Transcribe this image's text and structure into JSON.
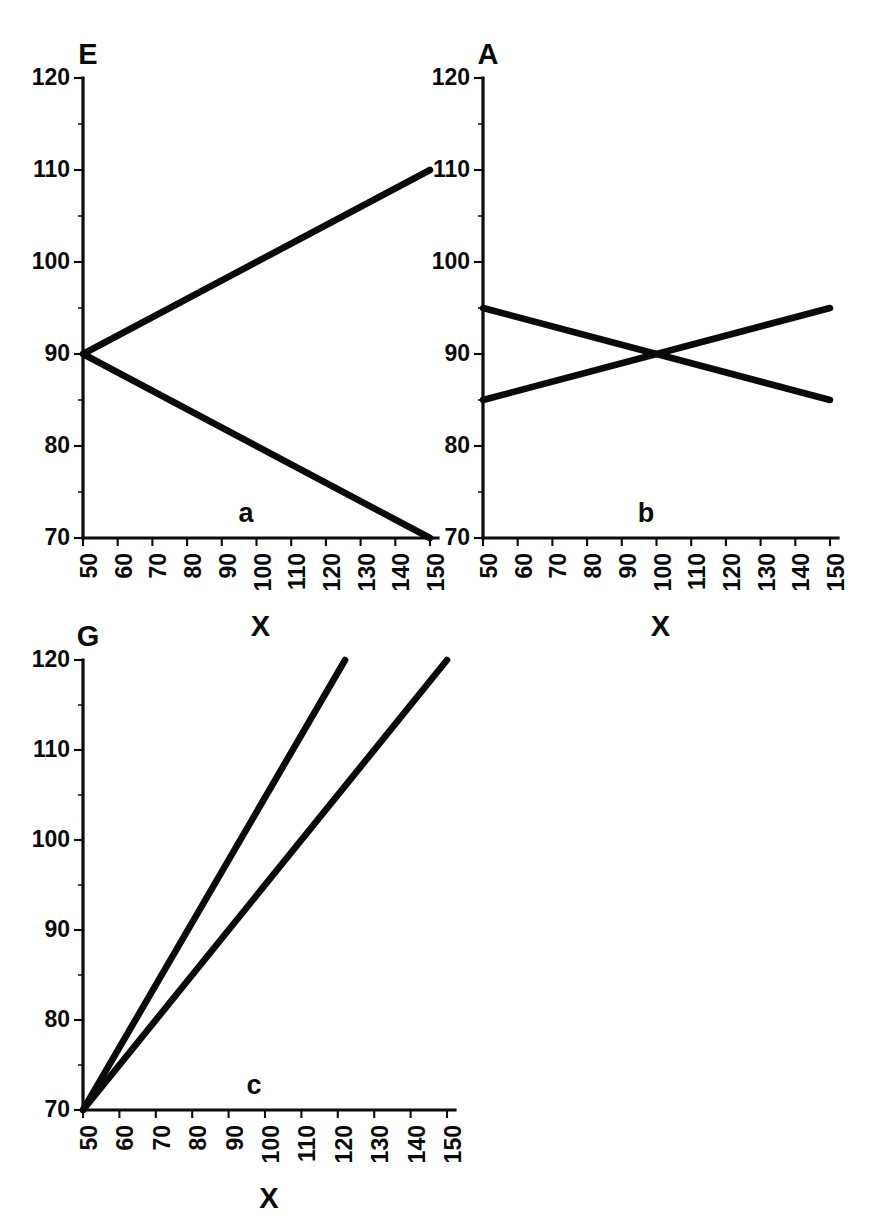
{
  "figure": {
    "background_color": "#ffffff",
    "ink_color": "#0b0b0b",
    "panels": [
      "a",
      "b",
      "c"
    ]
  },
  "chart_data": [
    {
      "id": "a",
      "type": "line",
      "panel_label": "a",
      "title": "",
      "xlabel": "X",
      "ylabel": "E",
      "xlim": [
        50,
        150
      ],
      "ylim": [
        70,
        120
      ],
      "xticks": [
        50,
        60,
        70,
        80,
        90,
        100,
        110,
        120,
        130,
        140,
        150
      ],
      "yticks": [
        70,
        80,
        90,
        100,
        110,
        120
      ],
      "xtick_labels": [
        "50",
        "60",
        "70",
        "80",
        "90",
        "100",
        "110",
        "120",
        "130",
        "140",
        "150"
      ],
      "ytick_labels": [
        "70",
        "80",
        "90",
        "100",
        "110",
        "120"
      ],
      "grid": false,
      "legend": "none",
      "series": [
        {
          "name": "upper",
          "x": [
            50,
            150
          ],
          "values": [
            90,
            110
          ]
        },
        {
          "name": "lower",
          "x": [
            50,
            150
          ],
          "values": [
            90,
            70
          ]
        }
      ]
    },
    {
      "id": "b",
      "type": "line",
      "panel_label": "b",
      "title": "",
      "xlabel": "X",
      "ylabel": "A",
      "xlim": [
        50,
        150
      ],
      "ylim": [
        70,
        120
      ],
      "xticks": [
        50,
        60,
        70,
        80,
        90,
        100,
        110,
        120,
        130,
        140,
        150
      ],
      "yticks": [
        70,
        80,
        90,
        100,
        110,
        120
      ],
      "xtick_labels": [
        "50",
        "60",
        "70",
        "80",
        "90",
        "100",
        "110",
        "120",
        "130",
        "140",
        "150"
      ],
      "ytick_labels": [
        "70",
        "80",
        "90",
        "100",
        "110",
        "120"
      ],
      "grid": false,
      "legend": "none",
      "series": [
        {
          "name": "descending",
          "x": [
            50,
            150
          ],
          "values": [
            95,
            85
          ]
        },
        {
          "name": "ascending",
          "x": [
            50,
            150
          ],
          "values": [
            85,
            95
          ]
        }
      ]
    },
    {
      "id": "c",
      "type": "line",
      "panel_label": "c",
      "title": "",
      "xlabel": "X",
      "ylabel": "G",
      "xlim": [
        50,
        150
      ],
      "ylim": [
        70,
        120
      ],
      "xticks": [
        50,
        60,
        70,
        80,
        90,
        100,
        110,
        120,
        130,
        140,
        150
      ],
      "yticks": [
        70,
        80,
        90,
        100,
        110,
        120
      ],
      "xtick_labels": [
        "50",
        "60",
        "70",
        "80",
        "90",
        "100",
        "110",
        "120",
        "130",
        "140",
        "150"
      ],
      "ytick_labels": [
        "70",
        "80",
        "90",
        "100",
        "110",
        "120"
      ],
      "grid": false,
      "legend": "none",
      "series": [
        {
          "name": "steep",
          "x": [
            50,
            122
          ],
          "values": [
            70,
            120
          ]
        },
        {
          "name": "shallow",
          "x": [
            50,
            150
          ],
          "values": [
            70,
            120
          ]
        }
      ]
    }
  ]
}
